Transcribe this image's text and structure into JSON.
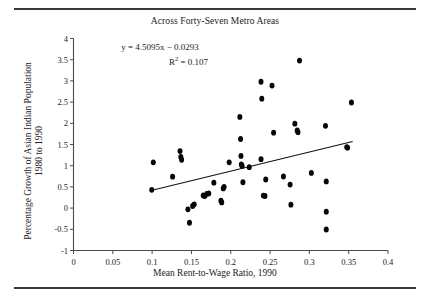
{
  "figure": {
    "title": "Across Forty-Seven Metro Areas",
    "xlabel": "Mean Rent-to-Wage Ratio, 1990",
    "ylabel_line1": "Percentage Growth of Asian Indian Population",
    "ylabel_line2": "1980 to 1990",
    "equation": "y = 4.5095x − 0.0293",
    "r_squared_prefix": "R",
    "r_squared_exp": "2",
    "r_squared_value": " = 0.107",
    "marker_color": "#070707",
    "line_color": "#111111",
    "axis_color": "#4a4a4a",
    "rule_color": "#3a3a3a"
  },
  "chart_data": {
    "type": "scatter",
    "title": "Across Forty-Seven Metro Areas",
    "xlabel": "Mean Rent-to-Wage Ratio, 1990",
    "ylabel": "Percentage Growth of Asian Indian Population 1980 to 1990",
    "xlim": [
      0,
      0.4
    ],
    "ylim": [
      -1,
      4
    ],
    "xticks": [
      0,
      0.05,
      0.1,
      0.15,
      0.2,
      0.25,
      0.3,
      0.35,
      0.4
    ],
    "xtick_labels": [
      "0",
      "0.05",
      "0.1",
      "0.15",
      "0.2",
      "0.25",
      "0.3",
      "0.35",
      "0.4"
    ],
    "yticks": [
      -1,
      -0.5,
      0,
      0.5,
      1,
      1.5,
      2,
      2.5,
      3,
      3.5,
      4
    ],
    "ytick_labels": [
      "-1",
      "-0.5",
      "0",
      "0.5",
      "1",
      "1.5",
      "2",
      "2.5",
      "3",
      "3.5",
      "4"
    ],
    "grid": false,
    "legend": false,
    "annotations": [
      "y = 4.5095x − 0.0293",
      "R² = 0.107"
    ],
    "trendline": {
      "type": "linear",
      "slope": 4.5095,
      "intercept": -0.0293,
      "r_squared": 0.107,
      "x_start": 0.1,
      "x_end": 0.355
    },
    "n_points": 47,
    "points": [
      [
        0.0995,
        0.43
      ],
      [
        0.1015,
        1.08
      ],
      [
        0.126,
        0.74
      ],
      [
        0.1355,
        1.345
      ],
      [
        0.1365,
        1.205
      ],
      [
        0.1375,
        1.14
      ],
      [
        0.1455,
        -0.03
      ],
      [
        0.1475,
        -0.345
      ],
      [
        0.1515,
        0.05
      ],
      [
        0.1535,
        0.09
      ],
      [
        0.165,
        0.3
      ],
      [
        0.167,
        0.285
      ],
      [
        0.1695,
        0.335
      ],
      [
        0.172,
        0.345
      ],
      [
        0.1785,
        0.6
      ],
      [
        0.1875,
        0.175
      ],
      [
        0.1885,
        0.135
      ],
      [
        0.1905,
        0.465
      ],
      [
        0.1915,
        0.5
      ],
      [
        0.198,
        1.08
      ],
      [
        0.2115,
        2.15
      ],
      [
        0.2125,
        1.63
      ],
      [
        0.213,
        1.23
      ],
      [
        0.2135,
        1.03
      ],
      [
        0.2145,
        0.995
      ],
      [
        0.2155,
        0.61
      ],
      [
        0.2235,
        0.965
      ],
      [
        0.2385,
        2.98
      ],
      [
        0.2385,
        1.155
      ],
      [
        0.2395,
        2.58
      ],
      [
        0.2415,
        0.295
      ],
      [
        0.2435,
        0.285
      ],
      [
        0.2445,
        0.675
      ],
      [
        0.2525,
        2.89
      ],
      [
        0.2545,
        1.78
      ],
      [
        0.267,
        0.745
      ],
      [
        0.2755,
        0.555
      ],
      [
        0.2765,
        0.08
      ],
      [
        0.2815,
        1.99
      ],
      [
        0.2845,
        1.83
      ],
      [
        0.2855,
        1.79
      ],
      [
        0.2875,
        3.48
      ],
      [
        0.3025,
        0.83
      ],
      [
        0.3205,
        1.94
      ],
      [
        0.3215,
        0.63
      ],
      [
        0.3215,
        -0.085
      ],
      [
        0.3215,
        -0.505
      ],
      [
        0.3475,
        1.44
      ],
      [
        0.3485,
        1.425
      ],
      [
        0.3535,
        2.49
      ]
    ]
  }
}
